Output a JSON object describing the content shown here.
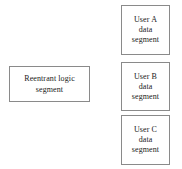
{
  "diagram": {
    "background_color": "#ffffff",
    "border_color": "#8a8a8a",
    "text_color": "#1a1a1a",
    "boxes": [
      {
        "id": "reentrant-logic-segment",
        "lines": [
          "Reentrant logic",
          "segment"
        ]
      },
      {
        "id": "user-a-data-segment",
        "lines": [
          "User A",
          "data",
          "segment"
        ]
      },
      {
        "id": "user-b-data-segment",
        "lines": [
          "User B",
          "data",
          "segment"
        ]
      },
      {
        "id": "user-c-data-segment",
        "lines": [
          "User C",
          "data",
          "segment"
        ]
      }
    ]
  }
}
